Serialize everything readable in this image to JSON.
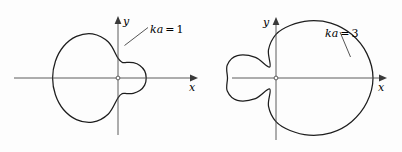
{
  "figure": {
    "name": "acoustic-radiation-patterns",
    "background_color": "#fdfdfd",
    "curve_color": "#1d1d1d",
    "axis_color": "#4a4a4a",
    "width": 402,
    "height": 152
  },
  "plots": [
    {
      "id": "left",
      "label": "ka = 1",
      "label_ka": "ka",
      "label_eq": "=",
      "label_value": "1",
      "x_axis_label": "x",
      "y_axis_label": "y",
      "origin": {
        "x": 118,
        "y": 78
      }
    },
    {
      "id": "right",
      "label": "ka = 3",
      "label_ka": "ka",
      "label_eq": "=",
      "label_value": "3",
      "x_axis_label": "x",
      "y_axis_label": "y",
      "origin": {
        "x": 276,
        "y": 78
      }
    }
  ],
  "chart_data": [
    {
      "type": "line",
      "subtype": "polar-directivity",
      "title": "ka = 1",
      "xlabel": "x",
      "ylabel": "y",
      "grid": false,
      "legend": "none",
      "annotations": [
        "ka = 1"
      ],
      "theta_deg": [
        0,
        15,
        30,
        45,
        60,
        75,
        90,
        105,
        120,
        135,
        150,
        165,
        180,
        195,
        210,
        225,
        240,
        255,
        270,
        285,
        300,
        315,
        330,
        345,
        360
      ],
      "r": [
        0.47,
        0.46,
        0.42,
        0.36,
        0.3,
        0.27,
        0.33,
        0.62,
        0.85,
        0.98,
        1.05,
        1.08,
        1.09,
        1.08,
        1.05,
        0.98,
        0.85,
        0.62,
        0.33,
        0.27,
        0.3,
        0.36,
        0.42,
        0.46,
        0.47
      ],
      "rlim": [
        0,
        1.1
      ],
      "note": "Large rear lobe with small forward lobe; cardioid-like pattern"
    },
    {
      "type": "line",
      "subtype": "polar-directivity",
      "title": "ka = 3",
      "xlabel": "x",
      "ylabel": "y",
      "grid": false,
      "legend": "none",
      "annotations": [
        "ka = 3"
      ],
      "theta_deg": [
        0,
        15,
        30,
        45,
        60,
        75,
        90,
        105,
        120,
        135,
        150,
        165,
        180,
        195,
        210,
        225,
        240,
        255,
        270,
        285,
        300,
        315,
        330,
        345,
        360
      ],
      "r": [
        1.0,
        0.97,
        0.9,
        0.8,
        0.68,
        0.56,
        0.45,
        0.3,
        0.13,
        0.3,
        0.46,
        0.52,
        0.5,
        0.52,
        0.46,
        0.3,
        0.13,
        0.3,
        0.45,
        0.56,
        0.68,
        0.8,
        0.9,
        0.97,
        1.0
      ],
      "rlim": [
        0,
        1.0
      ],
      "note": "Strong forward main lobe plus rear side lobes with nulls"
    }
  ]
}
